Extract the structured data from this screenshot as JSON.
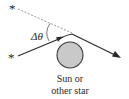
{
  "diagram": {
    "angle_label": "Δθ",
    "caption_line1": "Sun or",
    "caption_line2": "other star",
    "apparent_star_symbol": "*",
    "actual_star_symbol": "*",
    "colors": {
      "ray": "#2b2b2b",
      "dashed": "#8a8a8a",
      "body_fill": "#c9c9c9",
      "body_stroke": "#3a3a3a",
      "text": "#2a2a2a"
    }
  }
}
